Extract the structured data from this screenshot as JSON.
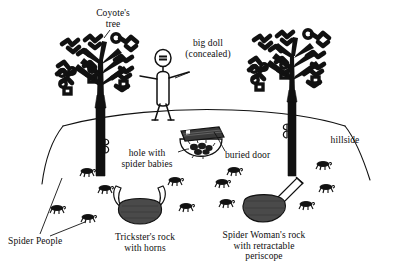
{
  "figure": {
    "ink_color": "#111111",
    "background_color": "#ffffff",
    "rock_fill": "#4a4a4a"
  },
  "labels": {
    "coyotes_tree": "Coyote's\ntree",
    "big_doll": "big doll\n(concealed)",
    "hillside": "hillside",
    "hole_with_spider_babies": "hole with\nspider babies",
    "buried_door": "buried door",
    "spider_people": "Spider People",
    "tricksters_rock": "Trickster's rock\nwith horns",
    "spider_womans_rock": "Spider Woman's rock\nwith retractable\nperiscope"
  },
  "elements": {
    "trees": [
      {
        "name": "coyotes-tree",
        "position": "left"
      },
      {
        "name": "right-tree",
        "position": "right"
      }
    ],
    "stick_figure": "big-doll-stick-figure",
    "rocks": [
      {
        "name": "tricksters-rock",
        "feature": "horns"
      },
      {
        "name": "spider-womans-rock",
        "feature": "retractable periscope"
      }
    ],
    "hole": "hole-with-spider-babies",
    "door": "buried-door",
    "hillside": "hillside-curve",
    "spider_people_count": 12
  }
}
